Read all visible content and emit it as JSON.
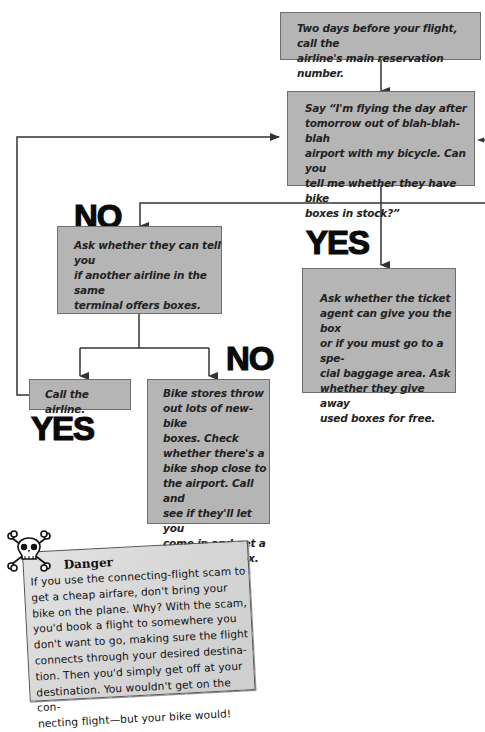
{
  "flowchart": {
    "start": {
      "text": "Two days before your flight, call the airline's main reservation number."
    },
    "ask_stock": {
      "text": "Say “I'm flying the day after tomorrow out of blah-blah-blah airport with my bicycle. Can you tell me whether they have bike boxes in stock?”"
    },
    "ask_other_airline": {
      "text": "Ask whether they can tell you if another airline in the same terminal offers boxes."
    },
    "ask_ticket_agent": {
      "text": "Ask whether the ticket agent can give you the box or if you must go to a special baggage area. Ask whether they give away used boxes for free."
    },
    "call_airline": {
      "text": "Call the airline."
    },
    "bike_stores": {
      "text": "Bike stores throw out lots of new-bike boxes. Check whether there's a bike shop close to the airport. Call and see if they'll let you come in and get a throw-away box."
    },
    "labels": {
      "no_first": "NO",
      "yes_first": "YES",
      "no_second": "NO",
      "yes_second": "YES"
    },
    "lines": {
      "start_box": [
        "Two days before your flight, call the",
        "airline's main reservation number."
      ],
      "ask_stock_box": [
        "Say “I'm flying the day after",
        "tomorrow out of blah-blah-blah",
        "airport with my bicycle. Can you",
        "tell me whether they have bike",
        "boxes in stock?”"
      ],
      "ask_other_airline_box": [
        "Ask whether they can tell you",
        "if another airline in the same",
        "terminal offers boxes."
      ],
      "ask_ticket_agent_box": [
        "Ask whether the ticket",
        "agent can give you the box",
        "or if you must go to a spe-",
        "cial baggage area. Ask",
        "whether they give away",
        "used boxes for free."
      ],
      "call_airline_box": [
        "Call the airline."
      ],
      "bike_stores_box": [
        "Bike stores throw",
        "out lots of new-bike",
        "boxes. Check",
        "whether there's a",
        "bike shop close to",
        "the airport. Call and",
        "see if they'll let you",
        "come in and get a",
        "throw-away box."
      ]
    }
  },
  "danger_note": {
    "icon": "skull-crossbones-icon",
    "title": "Danger",
    "lines": [
      "If you use the connecting-flight scam to",
      "get a cheap airfare, don't bring your",
      "bike on the plane. Why? With the scam,",
      "you'd book a flight to somewhere you",
      "don't want to go, making sure the flight",
      "connects through your desired destina-",
      "tion. Then you'd simply get off at your",
      "destination. You wouldn't get on the con-",
      "necting flight—but your bike would!"
    ]
  }
}
